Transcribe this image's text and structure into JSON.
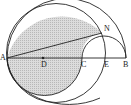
{
  "diagram": {
    "type": "geometry",
    "points": {
      "A": {
        "label": "A",
        "x": 7,
        "y": 58
      },
      "D": {
        "label": "D",
        "x": 43,
        "y": 58
      },
      "C": {
        "label": "C",
        "x": 82,
        "y": 58
      },
      "E": {
        "label": "E",
        "x": 105,
        "y": 58
      },
      "B": {
        "label": "B",
        "x": 126,
        "y": 58
      },
      "N": {
        "label": "N",
        "x": 102,
        "y": 33
      }
    },
    "colors": {
      "stroke": "#222222",
      "shade": "#d6d6d6",
      "background": "#ffffff"
    }
  }
}
